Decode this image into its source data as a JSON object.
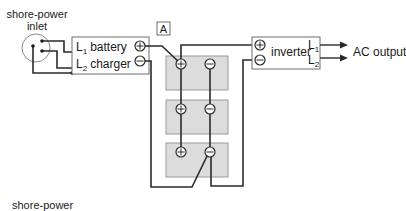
{
  "diagram": {
    "title_label": "A",
    "inlet": {
      "label_line1": "shore-power",
      "label_line2": "inlet"
    },
    "charger": {
      "l1": "L",
      "l1_sub": "1",
      "l1_text": "battery",
      "l2": "L",
      "l2_sub": "2",
      "l2_text": "charger",
      "pos_terminal": "+",
      "neg_terminal": "−"
    },
    "inverter": {
      "label": "inverter",
      "l1": "L",
      "l1_sub": "1",
      "l2": "L",
      "l2_sub": "2",
      "pos_terminal": "+",
      "neg_terminal": "−"
    },
    "output": {
      "label": "AC output"
    },
    "batteries": [
      {
        "name": "battery-1",
        "pos": "+",
        "neg": "−"
      },
      {
        "name": "battery-2",
        "pos": "+",
        "neg": "−"
      },
      {
        "name": "battery-3",
        "pos": "+",
        "neg": "−"
      }
    ],
    "footer": {
      "label": "shore-power"
    },
    "colors": {
      "wire": "#2a2a2a",
      "battery_fill": "#dcdcdc",
      "battery_stroke": "#9a9a9a",
      "box_stroke": "#6e6e6e"
    }
  }
}
